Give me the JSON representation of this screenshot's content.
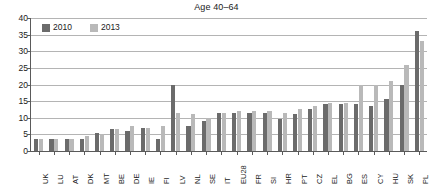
{
  "chart_data": {
    "type": "bar",
    "title": "Age 40–64",
    "xlabel": "",
    "ylabel": "",
    "ylim": [
      0,
      40
    ],
    "yticks": [
      0,
      5,
      10,
      15,
      20,
      25,
      30,
      35,
      40
    ],
    "grid": true,
    "legend_position": "top-left",
    "categories": [
      "UK",
      "LU",
      "AT",
      "DK",
      "MT",
      "BE",
      "DE",
      "IE",
      "FI",
      "LV",
      "NL",
      "SE",
      "IT",
      "EU28",
      "FR",
      "SI",
      "HR",
      "PT",
      "CZ",
      "EL",
      "BG",
      "ES",
      "CY",
      "HU",
      "SK",
      "PL"
    ],
    "series": [
      {
        "name": "2010",
        "color": "#6b6b6b",
        "values": [
          3.5,
          3.5,
          3.5,
          3.5,
          5.5,
          6.5,
          6.0,
          7.0,
          3.5,
          20.0,
          7.5,
          9.0,
          11.5,
          11.5,
          11.5,
          11.5,
          9.5,
          11.0,
          12.5,
          14.0,
          14.0,
          14.0,
          13.5,
          15.5,
          20.0,
          36.0
        ]
      },
      {
        "name": "2013",
        "color": "#b9b9b9",
        "values": [
          3.5,
          3.5,
          3.5,
          4.5,
          5.0,
          6.5,
          7.5,
          7.0,
          7.5,
          11.5,
          11.0,
          10.0,
          11.5,
          12.0,
          12.0,
          12.0,
          11.5,
          12.5,
          13.5,
          14.5,
          14.5,
          20.0,
          20.0,
          21.0,
          26.0,
          33.0
        ]
      }
    ]
  },
  "legend": {
    "items": [
      {
        "label": "2010",
        "color": "#6b6b6b"
      },
      {
        "label": "2013",
        "color": "#b9b9b9"
      }
    ]
  }
}
